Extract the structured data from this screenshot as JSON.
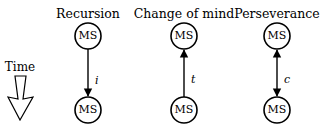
{
  "time_label": "Time",
  "node_label": "MS",
  "panels": [
    {
      "title": "Recursion",
      "edge_label": "i",
      "direction": "down"
    },
    {
      "title": "Change of mind",
      "edge_label": "t",
      "direction": "up"
    },
    {
      "title": "Perseverance",
      "edge_label": "c",
      "direction": "both"
    }
  ],
  "colors": {
    "stroke": "#000000",
    "background": "#ffffff"
  }
}
